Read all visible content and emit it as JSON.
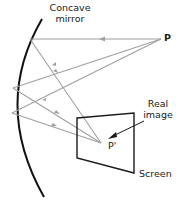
{
  "diagram": {
    "labels": {
      "mirror_line1": "Concave",
      "mirror_line2": "mirror",
      "object_point": "P",
      "image_point": "P'",
      "real_image_line1": "Real",
      "real_image_line2": "image",
      "screen": "Screen"
    },
    "colors": {
      "mirror": "#111111",
      "rays": "#a0a0a0",
      "screen": "#1a1a1a",
      "text": "#1a1a1a"
    },
    "elements": {
      "mirror": "concave mirror (arc)",
      "object": "point P (source)",
      "image": "point P' (real image)",
      "screen": "screen (quadrilateral)",
      "rays": 3
    }
  }
}
